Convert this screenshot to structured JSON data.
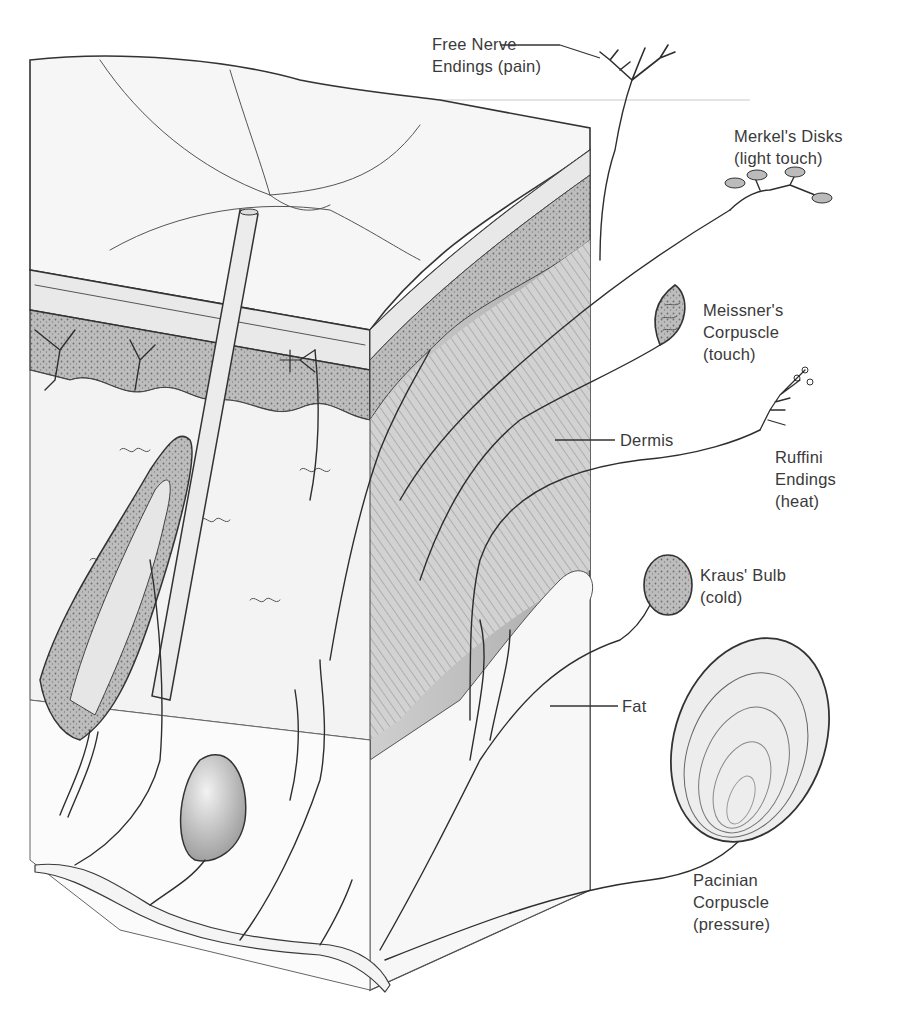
{
  "diagram": {
    "labels": {
      "free_nerve": {
        "line1": "Free Nerve",
        "line2": "Endings (pain)"
      },
      "merkel": {
        "line1": "Merkel's Disks",
        "line2": "(light touch)"
      },
      "meissner": {
        "line1": "Meissner's",
        "line2": "Corpuscle",
        "line3": "(touch)"
      },
      "dermis": {
        "line1": "Dermis"
      },
      "ruffini": {
        "line1": "Ruffini",
        "line2": "Endings",
        "line3": "(heat)"
      },
      "kraus": {
        "line1": "Kraus' Bulb",
        "line2": "(cold)"
      },
      "fat": {
        "line1": "Fat"
      },
      "pacinian": {
        "line1": "Pacinian",
        "line2": "Corpuscle",
        "line3": "(pressure)"
      }
    }
  }
}
